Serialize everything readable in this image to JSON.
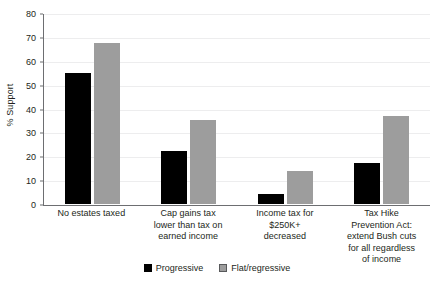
{
  "chart_data": {
    "type": "bar",
    "title": "",
    "xlabel": "",
    "ylabel": "% Support",
    "ylim": [
      0,
      80
    ],
    "yticks": [
      0,
      10,
      20,
      30,
      40,
      50,
      60,
      70,
      80
    ],
    "ytick_labels": [
      "0",
      "10",
      "20",
      "30",
      "40",
      "50",
      "60",
      "70",
      "80"
    ],
    "grid": true,
    "legend_position": "bottom-center",
    "categories": [
      "No estates taxed",
      "Cap gains tax lower than tax on earned income",
      "Income tax for $250K+ decreased",
      "Tax Hike Prevention Act: extend Bush cuts for all regardless of income"
    ],
    "category_lines": [
      [
        "No estates taxed"
      ],
      [
        "Cap gains tax",
        "lower than tax on",
        "earned income"
      ],
      [
        "Income tax for",
        "$250K+",
        "decreased"
      ],
      [
        "Tax Hike",
        "Prevention Act:",
        "extend Bush cuts",
        "for all regardless",
        "of income"
      ]
    ],
    "series": [
      {
        "name": "Progressive",
        "color": "#000000",
        "values": [
          55,
          22,
          4,
          17
        ]
      },
      {
        "name": "Flat/regressive",
        "color": "#9d9d9d",
        "values": [
          67.5,
          35,
          14,
          37
        ]
      }
    ]
  },
  "legend": {
    "items": [
      {
        "label": "Progressive",
        "swatch": "black-square-icon"
      },
      {
        "label": "Flat/regressive",
        "swatch": "gray-square-icon"
      }
    ]
  }
}
